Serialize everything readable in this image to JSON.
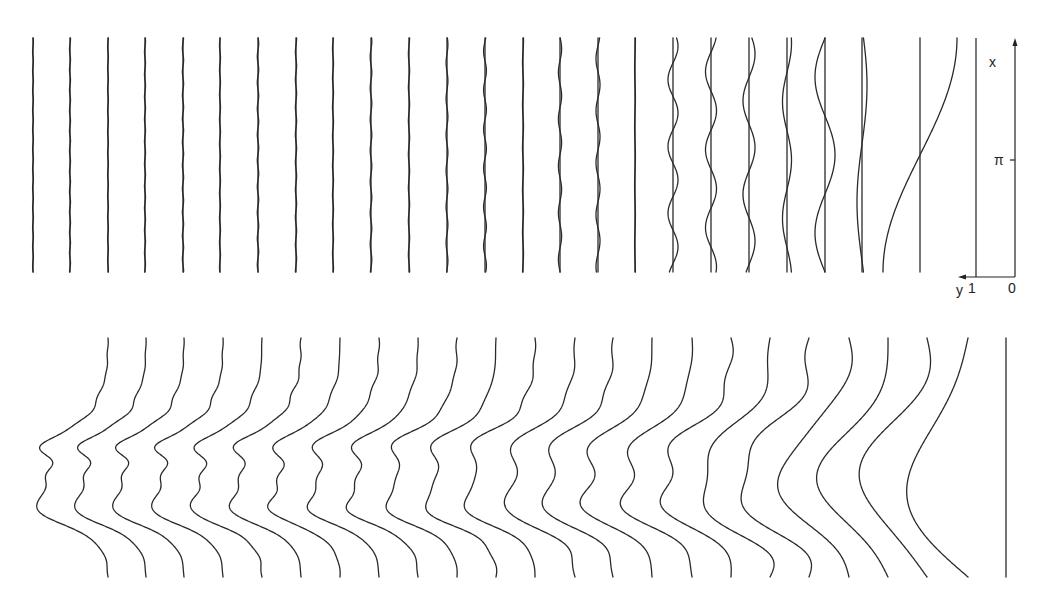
{
  "figure": {
    "top_panel": {
      "y_top": 38,
      "y_bottom": 272,
      "baseline_x": [
        33,
        70,
        108,
        145,
        183,
        220,
        258,
        296,
        333,
        371,
        409,
        447,
        485,
        523,
        560,
        598,
        635,
        673,
        711,
        749,
        787,
        825,
        862,
        920
      ],
      "harmonic_number": [
        24,
        23,
        22,
        21,
        20,
        19,
        18,
        17,
        16,
        15,
        14,
        13,
        12,
        11,
        10,
        9,
        8,
        7,
        6,
        5,
        4,
        3,
        2,
        1
      ],
      "amplitude_px": [
        0.4,
        0.5,
        0.4,
        0.5,
        0.6,
        0.5,
        0.7,
        0.6,
        0.5,
        0.8,
        0.6,
        0.9,
        1.4,
        0.5,
        1.6,
        2.0,
        0.4,
        5.0,
        5.5,
        6.0,
        4.5,
        10.0,
        5.0,
        37.0
      ],
      "phase": [
        0.3,
        1.2,
        2.1,
        0.7,
        1.9,
        2.8,
        0.2,
        1.5,
        2.4,
        0.9,
        1.7,
        0.4,
        2.6,
        1.1,
        0.1,
        2.2,
        1.4,
        0.8,
        2.0,
        0.5,
        1.3,
        3.14,
        0.3,
        1.5708
      ]
    },
    "axis": {
      "x_label": "x",
      "pi_label": "π",
      "y_label": "y",
      "y_tick_1": "1",
      "y_tick_0": "0"
    },
    "bottom_panel": {
      "y_top": 338,
      "y_bottom": 577,
      "profile_top_x": [
        108,
        146,
        184,
        223,
        262,
        301,
        340,
        379,
        418,
        457,
        496,
        535,
        575,
        613,
        652,
        692,
        731,
        770,
        809,
        849,
        888,
        927,
        968
      ],
      "terms_included": [
        24,
        23,
        22,
        21,
        20,
        19,
        18,
        17,
        16,
        15,
        14,
        13,
        12,
        11,
        10,
        9,
        8,
        7,
        6,
        5,
        4,
        3,
        2
      ],
      "reference_line_x": 1006
    }
  }
}
